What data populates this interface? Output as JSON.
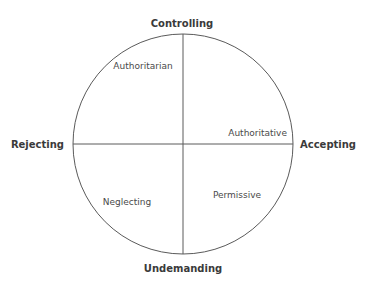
{
  "diagram": {
    "axes": {
      "top": "Controlling",
      "bottom": "Undemanding",
      "left": "Rejecting",
      "right": "Accepting"
    },
    "quadrants": {
      "top_left": "Authoritarian",
      "top_right": "Authoritative",
      "bottom_left": "Neglecting",
      "bottom_right": "Permissive"
    },
    "colors": {
      "line": "#5a5a5a",
      "axis_text": "#3a3a3a",
      "quadrant_text": "#4a4a4a",
      "background": "#ffffff"
    }
  }
}
